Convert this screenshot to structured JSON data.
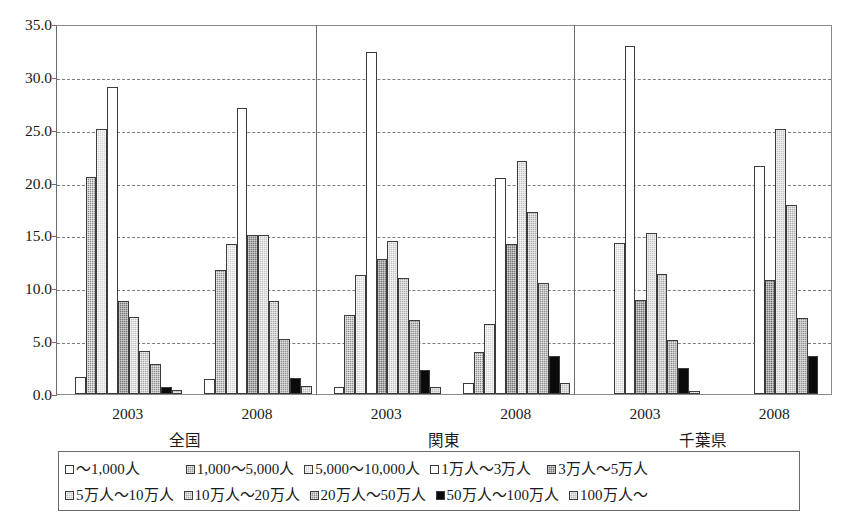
{
  "chart_data": {
    "type": "bar",
    "title": "",
    "subtitle": "",
    "xlabel": "",
    "ylabel": "",
    "ylim": [
      0.0,
      35.0
    ],
    "ytick_labels": [
      "0.0",
      "5.0",
      "10.0",
      "15.0",
      "20.0",
      "25.0",
      "30.0",
      "35.0"
    ],
    "ytick_values": [
      0.0,
      5.0,
      10.0,
      15.0,
      20.0,
      25.0,
      30.0,
      35.0
    ],
    "grid": "horizontal dashed",
    "legend_position": "bottom",
    "group_labels": [
      "全国",
      "関東",
      "千葉県"
    ],
    "categories": [
      "2003",
      "2008",
      "2003",
      "2008",
      "2003",
      "2008"
    ],
    "group_category_labels": [
      {
        "group": "全国",
        "years": [
          "2003",
          "2008"
        ]
      },
      {
        "group": "関東",
        "years": [
          "2003",
          "2008"
        ]
      },
      {
        "group": "千葉県",
        "years": [
          "2003",
          "2008"
        ]
      }
    ],
    "series": [
      {
        "name": "～1,000人",
        "key": "s0",
        "pattern": "open-white",
        "values": [
          1.6,
          1.4,
          0.7,
          1.0,
          null,
          null
        ]
      },
      {
        "name": "1,000～5,000人",
        "key": "s1",
        "pattern": "dark-gray-dotted",
        "values": [
          20.5,
          11.7,
          7.5,
          4.0,
          null,
          null
        ]
      },
      {
        "name": "5,000～10,000人",
        "key": "s2",
        "pattern": "light-gray-dotted",
        "values": [
          25.1,
          14.2,
          11.3,
          6.6,
          14.3,
          null
        ]
      },
      {
        "name": "1万人～3万人",
        "key": "s3",
        "pattern": "open-white",
        "values": [
          29.0,
          27.1,
          32.4,
          20.4,
          32.9,
          21.6
        ]
      },
      {
        "name": "3万人～5万人",
        "key": "s4",
        "pattern": "dark-gray-dotted",
        "values": [
          8.8,
          15.0,
          12.8,
          14.2,
          8.9,
          10.8
        ]
      },
      {
        "name": "5万人～10万人",
        "key": "s5",
        "pattern": "mid-gray-dotted",
        "values": [
          7.3,
          15.0,
          14.5,
          22.0,
          15.2,
          25.1
        ]
      },
      {
        "name": "10万人～20万人",
        "key": "s6",
        "pattern": "light-gray-dotted",
        "values": [
          4.1,
          8.8,
          11.0,
          17.2,
          11.4,
          17.9
        ]
      },
      {
        "name": "20万人～50万人",
        "key": "s7",
        "pattern": "mid-gray-dotted",
        "values": [
          2.8,
          5.2,
          7.0,
          10.5,
          5.1,
          7.2
        ]
      },
      {
        "name": "50万人～100万人",
        "key": "s8",
        "pattern": "solid-black",
        "values": [
          0.7,
          1.5,
          2.3,
          3.6,
          2.5,
          3.6
        ]
      },
      {
        "name": "100万人～",
        "key": "s9",
        "pattern": "light-gray-dotted",
        "values": [
          0.4,
          0.8,
          0.7,
          1.0,
          0.3,
          null
        ]
      }
    ]
  },
  "legend": {
    "rows": [
      [
        {
          "label": "～1,000人",
          "pattern": "p0"
        },
        {
          "label": "1,000～5,000人",
          "pattern": "p1"
        },
        {
          "label": "5,000～10,000人",
          "pattern": "p2"
        },
        {
          "label": "1万人～3万人",
          "pattern": "p3"
        },
        {
          "label": "3万人～5万人",
          "pattern": "p4"
        }
      ],
      [
        {
          "label": "5万人～10万人",
          "pattern": "p5"
        },
        {
          "label": "10万人～20万人",
          "pattern": "p6"
        },
        {
          "label": "20万人～50万人",
          "pattern": "p7"
        },
        {
          "label": "50万人～100万人",
          "pattern": "p8"
        },
        {
          "label": "100万人～",
          "pattern": "p9"
        }
      ]
    ]
  },
  "colors": {
    "axis": "#6a6a6a",
    "grid": "#7d7d7d",
    "bar_outline": "#3b3b3b",
    "text": "#1a1a1a",
    "background": "#ffffff"
  }
}
